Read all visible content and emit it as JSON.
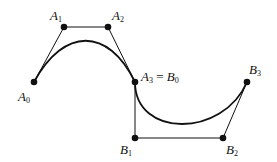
{
  "diagram": {
    "colors": {
      "stroke": "#111111",
      "background": "#ffffff"
    },
    "points": [
      {
        "id": "A0",
        "letter": "A",
        "sub": "0",
        "x": 34,
        "y": 82
      },
      {
        "id": "A1",
        "letter": "A",
        "sub": "1",
        "x": 64,
        "y": 27
      },
      {
        "id": "A2",
        "letter": "A",
        "sub": "2",
        "x": 108,
        "y": 27
      },
      {
        "id": "A3",
        "letter": "A",
        "sub": "3",
        "x": 135,
        "y": 82
      },
      {
        "id": "B1",
        "letter": "B",
        "sub": "1",
        "x": 135,
        "y": 138
      },
      {
        "id": "B2",
        "letter": "B",
        "sub": "2",
        "x": 223,
        "y": 138
      },
      {
        "id": "B3",
        "letter": "B",
        "sub": "3",
        "x": 247,
        "y": 82
      }
    ],
    "labels": {
      "A0": {
        "letter": "A",
        "sub": "0"
      },
      "A1": {
        "letter": "A",
        "sub": "1"
      },
      "A2": {
        "letter": "A",
        "sub": "2"
      },
      "A3_B0": {
        "letter1": "A",
        "sub1": "3",
        "eq": " = ",
        "letter2": "B",
        "sub2": "0"
      },
      "B1": {
        "letter": "B",
        "sub": "1"
      },
      "B2": {
        "letter": "B",
        "sub": "2"
      },
      "B3": {
        "letter": "B",
        "sub": "3"
      }
    }
  }
}
